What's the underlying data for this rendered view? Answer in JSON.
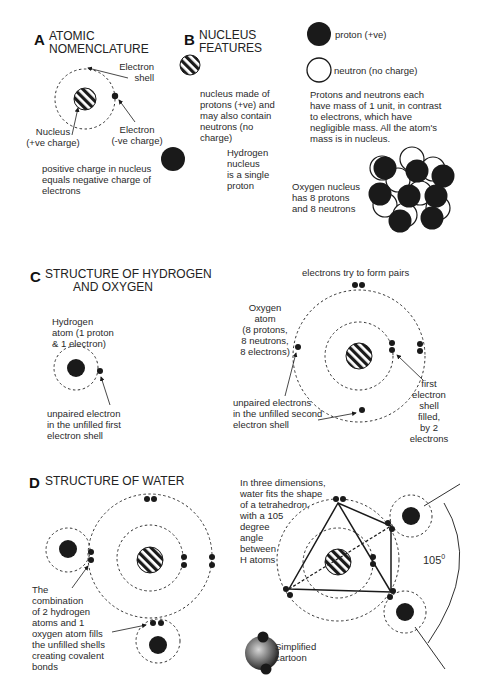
{
  "sections": {
    "a": {
      "letter": "A",
      "title_line1": "ATOMIC",
      "title_line2": "NOMENCLATURE",
      "labels": {
        "electron_shell_1": "Electron",
        "electron_shell_2": "shell",
        "nucleus_1": "Nucleus",
        "nucleus_2": "(+ve charge)",
        "electron_1": "Electron",
        "electron_2": "(-ve charge)"
      },
      "note_lines": [
        "positive charge in nucleus",
        "equals negative charge of",
        "electrons"
      ]
    },
    "b": {
      "letter": "B",
      "title_line1": "NUCLEUS",
      "title_line2": "FEATURES",
      "nucleus_desc": [
        "nucleus made of",
        "protons (+ve) and",
        "may also contain",
        "neutrons (no",
        "charge)"
      ],
      "hydrogen_desc": [
        "Hydrogen",
        "nucleus",
        "is a single",
        "proton"
      ],
      "legend": {
        "proton": "proton (+ve)",
        "neutron": "neutron (no charge)"
      },
      "mass_note": [
        "Protons and neutrons each",
        "have mass of 1 unit, in contrast",
        "to electrons, which have",
        "negligible mass. All the atom's",
        "mass is in nucleus."
      ],
      "oxygen_nucleus": [
        "Oxygen nucleus",
        "has 8 protons",
        "and 8 neutrons"
      ]
    },
    "c": {
      "letter": "C",
      "title_line1": "STRUCTURE OF HYDROGEN",
      "title_line2": "AND OXYGEN",
      "hydrogen_atom": [
        "Hydrogen",
        "atom (1 proton",
        "& 1 electron)"
      ],
      "hydrogen_unpaired": [
        "unpaired electron",
        "in the unfilled first",
        "electron shell"
      ],
      "pairs_note": "electrons try to form pairs",
      "oxygen_atom": [
        "Oxygen",
        "atom",
        "(8 protons,",
        "8 neutrons,",
        "8 electrons)"
      ],
      "oxygen_unpaired": [
        "unpaired electrons",
        "in the unfilled second",
        "electron shell"
      ],
      "first_shell": [
        "first",
        "electron",
        "shell",
        "filled,",
        "by 2",
        "electrons"
      ]
    },
    "d": {
      "letter": "D",
      "title_line1": "STRUCTURE OF WATER",
      "combination_note": [
        "The",
        "combination",
        "of 2 hydrogen",
        "atoms and 1",
        "oxygen atom fills",
        "the unfilled shells",
        "creating covalent",
        "bonds"
      ],
      "three_d_note": [
        "In three dimensions,",
        "water fits the shape",
        "of a tetrahedron,",
        "with a 105",
        "degree",
        "angle",
        "between",
        "H atoms"
      ],
      "angle_label": "105",
      "angle_unit": "0",
      "cartoon_label": [
        "Simplified",
        "cartoon"
      ]
    }
  },
  "colors": {
    "ink": "#1a1a1a",
    "text": "#2a2a2a",
    "background": "#ffffff"
  }
}
